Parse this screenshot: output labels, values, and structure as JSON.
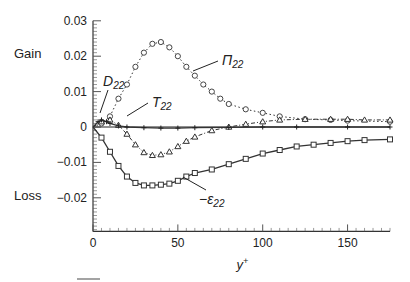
{
  "chart_data": {
    "type": "line",
    "title": "",
    "xlabel": "y+",
    "ylabel": "",
    "xlim": [
      0,
      175
    ],
    "ylim": [
      -0.03,
      0.03
    ],
    "xticks": [
      "0",
      "50",
      "100",
      "150"
    ],
    "yticks": [
      "0.03",
      "0.02",
      "0.01",
      "0",
      "-0.01",
      "-0.02"
    ],
    "side_labels": {
      "gain": "Gain",
      "loss": "Loss"
    },
    "grid": false,
    "series": [
      {
        "name": "Π22",
        "label": "Π22",
        "marker": "circle",
        "linestyle": "dotted",
        "x": [
          0,
          5,
          10,
          15,
          20,
          25,
          30,
          35,
          40,
          45,
          50,
          55,
          60,
          65,
          70,
          75,
          80,
          90,
          100,
          110,
          125,
          140,
          150,
          175
        ],
        "y": [
          0,
          0.001,
          0.003,
          0.008,
          0.012,
          0.017,
          0.021,
          0.0235,
          0.024,
          0.0225,
          0.02,
          0.017,
          0.0145,
          0.012,
          0.01,
          0.008,
          0.0065,
          0.005,
          0.004,
          0.003,
          0.0022,
          0.002,
          0.0018,
          0.0015
        ]
      },
      {
        "name": "−ε22",
        "label": "−ε22",
        "marker": "square",
        "linestyle": "solid",
        "x": [
          0,
          5,
          10,
          15,
          20,
          25,
          30,
          35,
          40,
          45,
          50,
          55,
          60,
          70,
          80,
          90,
          100,
          110,
          120,
          130,
          140,
          150,
          160,
          175
        ],
        "y": [
          0,
          -0.003,
          -0.007,
          -0.011,
          -0.014,
          -0.0158,
          -0.0165,
          -0.0165,
          -0.0163,
          -0.016,
          -0.0152,
          -0.014,
          -0.013,
          -0.012,
          -0.0105,
          -0.009,
          -0.0075,
          -0.0065,
          -0.0055,
          -0.005,
          -0.0045,
          -0.004,
          -0.0037,
          -0.0035
        ]
      },
      {
        "name": "T22",
        "label": "T22",
        "marker": "triangle",
        "linestyle": "dashdot",
        "x": [
          0,
          5,
          10,
          15,
          20,
          25,
          30,
          35,
          40,
          45,
          50,
          55,
          60,
          70,
          80,
          90,
          100,
          110,
          125,
          140,
          150,
          160,
          175
        ],
        "y": [
          0,
          0.0015,
          0.002,
          0.0005,
          -0.002,
          -0.005,
          -0.0072,
          -0.008,
          -0.0078,
          -0.007,
          -0.0055,
          -0.004,
          -0.0028,
          -0.001,
          0,
          0.0008,
          0.0015,
          0.002,
          0.0022,
          0.0022,
          0.0022,
          0.002,
          0.002
        ]
      },
      {
        "name": "D22",
        "label": "D22",
        "marker": "plus",
        "linestyle": "solid",
        "x": [
          0,
          3,
          5,
          8,
          10,
          15,
          20,
          30,
          40,
          50,
          60,
          80,
          100,
          120,
          150,
          175
        ],
        "y": [
          0,
          0.0015,
          0.002,
          0.0015,
          0.001,
          0.0003,
          0,
          -0.0002,
          -0.0003,
          -0.0003,
          -0.0002,
          -0.0001,
          0,
          0,
          0,
          0
        ]
      }
    ]
  }
}
